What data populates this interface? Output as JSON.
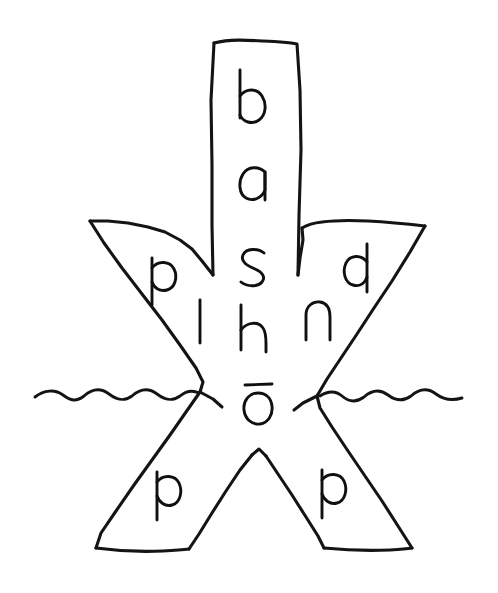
{
  "figure": {
    "title": "bashō",
    "kind": "hand-drawn diagram",
    "background_color": "#ffffff",
    "ink_color": "#141414",
    "description": "Hand-drawn asterisk / star-shaped glyph resembling a banana-plant or X-figure standing in water, annotated with handwritten letters.",
    "romanization": "bashō"
  },
  "center_column": {
    "name": "vertical-trunk",
    "letters": [
      {
        "char": "b",
        "x": 255,
        "y": 95
      },
      {
        "char": "a",
        "x": 255,
        "y": 185
      },
      {
        "char": "s",
        "x": 255,
        "y": 265
      },
      {
        "char": "h",
        "x": 255,
        "y": 330
      },
      {
        "char": "ō",
        "x": 258,
        "y": 400
      }
    ],
    "reading": "bashō"
  },
  "arms": [
    {
      "name": "upper-left-arm",
      "position": "upper-left",
      "letters": [
        {
          "char": "p",
          "x": 163,
          "y": 278
        },
        {
          "char": "l",
          "x": 200,
          "y": 322
        }
      ]
    },
    {
      "name": "upper-right-arm",
      "position": "upper-right",
      "letters": [
        {
          "char": "d",
          "x": 357,
          "y": 268
        },
        {
          "char": "n",
          "x": 318,
          "y": 318
        }
      ]
    },
    {
      "name": "lower-left-leg",
      "position": "lower-left",
      "letters": [
        {
          "char": "p",
          "x": 166,
          "y": 492
        }
      ]
    },
    {
      "name": "lower-right-leg",
      "position": "lower-right",
      "letters": [
        {
          "char": "p",
          "x": 331,
          "y": 490
        }
      ]
    }
  ],
  "water_line": {
    "name": "water-surface",
    "label": "wavy waterline",
    "y": 393,
    "left_segment_x": [
      35,
      198
    ],
    "right_segment_x": [
      320,
      462
    ],
    "hump_count_left": 4,
    "hump_count_right": 3
  }
}
